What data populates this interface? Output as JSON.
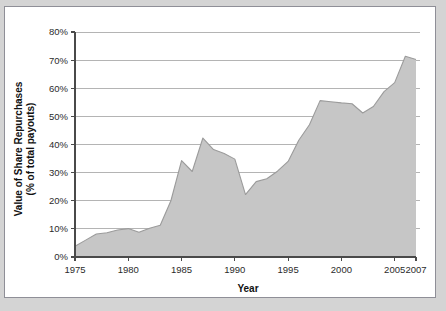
{
  "figure": {
    "background_color": "#d4d4d4",
    "panel_color": "#ffffff",
    "border_color": "#8f8f97"
  },
  "chart_data": {
    "type": "area",
    "title": "",
    "subtitle": "",
    "xlabel": "Year",
    "ylabel": "Value of Share Repurchases\n(% of total payouts)",
    "ylabel_line1": "Value of Share Repurchases",
    "ylabel_line2": "(% of total payouts)",
    "xlim": [
      1975,
      2007
    ],
    "ylim": [
      0,
      80
    ],
    "grid": true,
    "grid_axis": "y",
    "legend": false,
    "legend_position": "none",
    "series_name": "Value of Share Repurchases",
    "fill_color": "#c6c6c6",
    "line_color": "#9b9b9b",
    "yticks": [
      0,
      10,
      20,
      30,
      40,
      50,
      60,
      70,
      80
    ],
    "ytick_labels": [
      "0%",
      "10%",
      "20%",
      "30%",
      "40%",
      "50%",
      "60%",
      "70%",
      "80%"
    ],
    "xticks": [
      1975,
      1980,
      1985,
      1990,
      1995,
      2000,
      2005,
      2007
    ],
    "xtick_labels": [
      "1975",
      "1980",
      "1985",
      "1990",
      "1995",
      "2000",
      "2005",
      "2007"
    ],
    "x": [
      1975,
      1976,
      1977,
      1978,
      1979,
      1980,
      1981,
      1982,
      1983,
      1984,
      1985,
      1986,
      1987,
      1988,
      1989,
      1990,
      1991,
      1992,
      1993,
      1994,
      1995,
      1996,
      1997,
      1998,
      1999,
      2000,
      2001,
      2002,
      2003,
      2004,
      2005,
      2006,
      2007
    ],
    "values": [
      3.8,
      6.0,
      8.2,
      8.6,
      9.6,
      10.1,
      8.8,
      10.2,
      11.3,
      20.0,
      34.3,
      30.4,
      42.3,
      38.2,
      36.8,
      34.8,
      22.2,
      26.8,
      27.8,
      30.5,
      34.0,
      41.5,
      47.0,
      55.6,
      55.2,
      54.8,
      54.5,
      51.2,
      53.5,
      58.8,
      62.0,
      71.4,
      70.2
    ]
  }
}
